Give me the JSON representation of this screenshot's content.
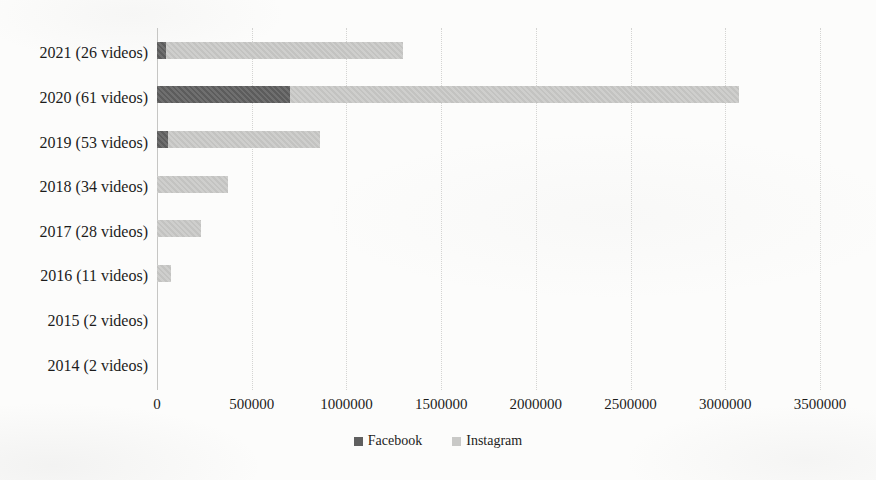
{
  "chart_data": {
    "type": "bar",
    "orientation": "horizontal",
    "stacked": true,
    "title": "",
    "xlabel": "",
    "ylabel": "",
    "categories": [
      "2021 (26 videos)",
      "2020 (61 videos)",
      "2019 (53 videos)",
      "2018 (34 videos)",
      "2017 (28 videos)",
      "2016 (11 videos)",
      "2015 (2 videos)",
      "2014 (2 videos)"
    ],
    "series": [
      {
        "name": "Facebook",
        "color": "#5f5f5f",
        "values": [
          50000,
          700000,
          60000,
          0,
          0,
          0,
          0,
          0
        ]
      },
      {
        "name": "Instagram",
        "color": "#c9c9c7",
        "values": [
          1250000,
          2370000,
          800000,
          375000,
          230000,
          75000,
          0,
          0
        ]
      }
    ],
    "xlim": [
      0,
      3500000
    ],
    "x_ticks": [
      0,
      500000,
      1000000,
      1500000,
      2000000,
      2500000,
      3000000,
      3500000
    ],
    "x_tick_labels": [
      "0",
      "500000",
      "1000000",
      "1500000",
      "2000000",
      "2500000",
      "3000000",
      "3500000"
    ],
    "grid": "vertical-dotted",
    "legend_position": "bottom-center"
  },
  "style": {
    "gridline_color": "#d4d4d2",
    "axis_line_color": "#c6c6c4",
    "text_color": "#1c1c1c",
    "background_color": "#fcfcfb"
  }
}
